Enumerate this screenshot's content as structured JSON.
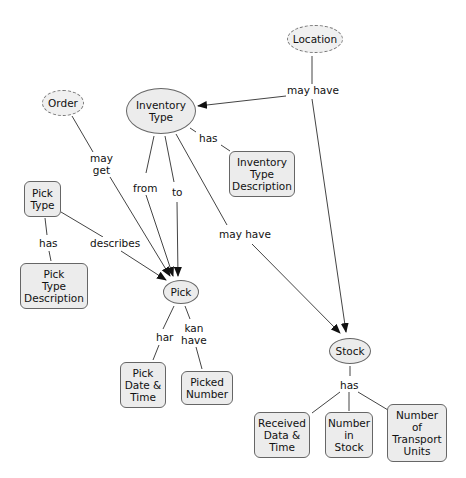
{
  "diagram": {
    "type": "concept-map",
    "colors": {
      "node_fill": "#ececec",
      "node_border": "#666666",
      "line": "#444444",
      "background": "#ffffff"
    },
    "nodes": [
      {
        "id": "location",
        "label": "Location",
        "shape": "dashed-ellipse"
      },
      {
        "id": "order",
        "label": "Order",
        "shape": "dashed-ellipse"
      },
      {
        "id": "inventory_type",
        "label": "Inventory\nType",
        "shape": "ellipse"
      },
      {
        "id": "inventory_type_description",
        "label": "Inventory\nType\nDescription",
        "shape": "rounded-rect"
      },
      {
        "id": "pick_type",
        "label": "Pick\nType",
        "shape": "rounded-rect"
      },
      {
        "id": "pick_type_description",
        "label": "Pick\nType\nDescription",
        "shape": "rounded-rect"
      },
      {
        "id": "pick",
        "label": "Pick",
        "shape": "ellipse"
      },
      {
        "id": "pick_date_time",
        "label": "Pick\nDate &\nTime",
        "shape": "rounded-rect"
      },
      {
        "id": "picked_number",
        "label": "Picked\nNumber",
        "shape": "rounded-rect"
      },
      {
        "id": "stock",
        "label": "Stock",
        "shape": "ellipse"
      },
      {
        "id": "received_data_time",
        "label": "Received\nData &\nTime",
        "shape": "rounded-rect"
      },
      {
        "id": "number_in_stock",
        "label": "Number\nin\nStock",
        "shape": "rounded-rect"
      },
      {
        "id": "number_transport_units",
        "label": "Number\nof\nTransport\nUnits",
        "shape": "rounded-rect"
      }
    ],
    "edges": [
      {
        "from": "location",
        "to": "inventory_type",
        "label": "may have",
        "arrow": true
      },
      {
        "from": "location",
        "to": "stock",
        "label": "may have",
        "arrow": true
      },
      {
        "from": "order",
        "to": "pick",
        "label": "may\nget",
        "arrow": true
      },
      {
        "from": "inventory_type",
        "to": "inventory_type_description",
        "label": "has",
        "arrow": false
      },
      {
        "from": "inventory_type",
        "to": "pick",
        "label": "from",
        "arrow": true
      },
      {
        "from": "inventory_type",
        "to": "pick",
        "label": "to",
        "arrow": true
      },
      {
        "from": "inventory_type",
        "to": "stock",
        "label": "may have",
        "arrow": true
      },
      {
        "from": "pick_type",
        "to": "pick_type_description",
        "label": "has",
        "arrow": false
      },
      {
        "from": "pick_type",
        "to": "pick",
        "label": "describes",
        "arrow": true
      },
      {
        "from": "pick",
        "to": "pick_date_time",
        "label": "har",
        "arrow": false
      },
      {
        "from": "pick",
        "to": "picked_number",
        "label": "kan\nhave",
        "arrow": false
      },
      {
        "from": "stock",
        "to": "received_data_time",
        "label": "has",
        "arrow": false
      },
      {
        "from": "stock",
        "to": "number_in_stock",
        "label": "has",
        "arrow": false
      },
      {
        "from": "stock",
        "to": "number_transport_units",
        "label": "has",
        "arrow": false
      }
    ]
  }
}
